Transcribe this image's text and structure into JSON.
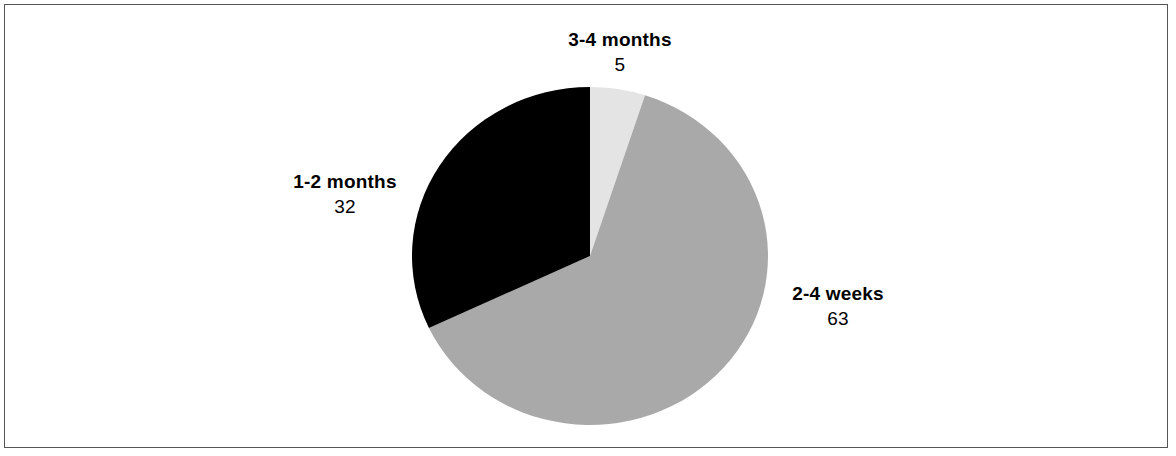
{
  "chart_data": {
    "type": "pie",
    "title": "",
    "subtitle": "",
    "xlabel": "",
    "ylabel": "",
    "legend_position": "none",
    "grid": false,
    "total": 100,
    "start_angle_deg": -90,
    "direction": "clockwise",
    "categories": [
      "3-4 months",
      "2-4 weeks",
      "1-2 months"
    ],
    "values": [
      5,
      63,
      32
    ],
    "slices": [
      {
        "label": "3-4 months",
        "value": 5,
        "value_text": "5",
        "color": "#E4E4E4",
        "angle_deg": 18,
        "start_deg": 0,
        "end_deg": 18
      },
      {
        "label": "2-4 weeks",
        "value": 63,
        "value_text": "63",
        "color": "#A9A9A9",
        "angle_deg": 226.8,
        "start_deg": 18,
        "end_deg": 244.8
      },
      {
        "label": "1-2 months",
        "value": 32,
        "value_text": "32",
        "color": "#000000",
        "angle_deg": 115.2,
        "start_deg": 244.8,
        "end_deg": 360
      }
    ],
    "geometry": {
      "center_x": 590,
      "center_y": 256,
      "radius_x": 178,
      "radius_y": 169
    }
  },
  "figure": {
    "background_color": "#FFFFFF",
    "border_color": "#555555"
  }
}
